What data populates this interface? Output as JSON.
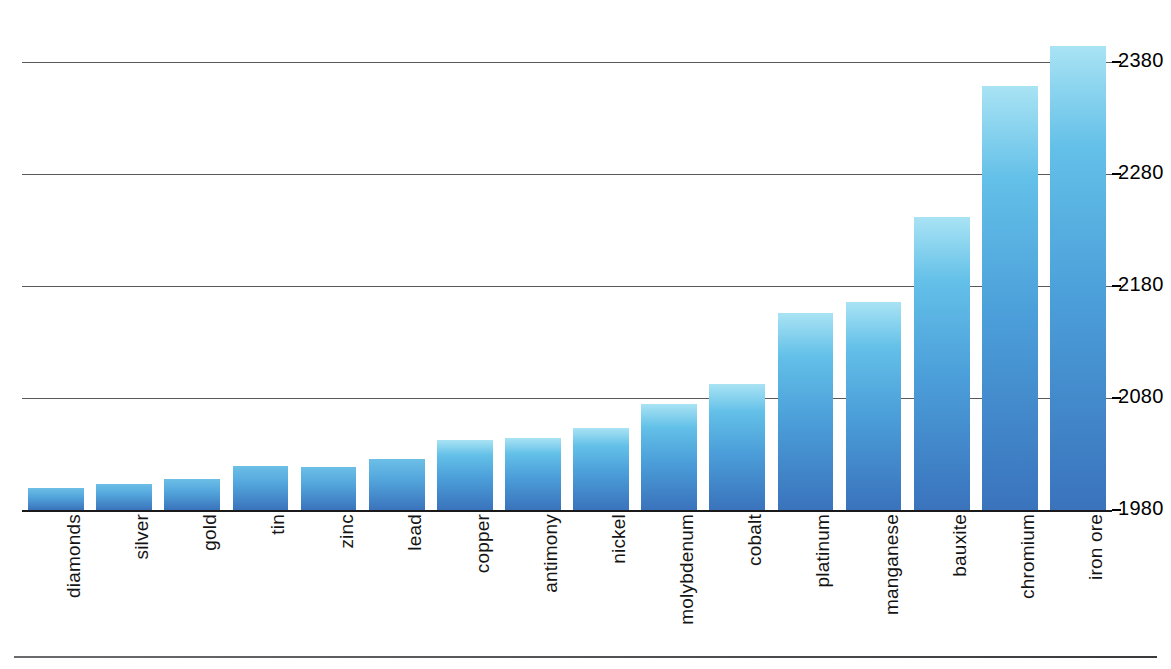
{
  "chart_data": {
    "type": "bar",
    "title": "",
    "subtitle": "",
    "xlabel": "",
    "ylabel": "",
    "ylim": [
      1980,
      2400
    ],
    "grid": true,
    "legend": "none",
    "orientation": "vertical",
    "y_tick_labels": [
      "1980",
      "2080",
      "2180",
      "2280",
      "2380"
    ],
    "y_ticks": [
      1980,
      2080,
      2180,
      2280,
      2380
    ],
    "y_axis_side": "right",
    "categories": [
      "diamonds",
      "silver",
      "gold",
      "tin",
      "zinc",
      "lead",
      "copper",
      "antimony",
      "nickel",
      "molybdenum",
      "cobalt",
      "platinum",
      "manganese",
      "bauxite",
      "chromium",
      "iron ore"
    ],
    "values": [
      2000,
      2003,
      2008,
      2019,
      2018,
      2026,
      2043,
      2044,
      2053,
      2075,
      2093,
      2156,
      2166,
      2242,
      2359,
      2395
    ],
    "bar_color_top": "#a9e3f4",
    "bar_color_bottom": "#3a73bc",
    "gridline_color": "#59595b",
    "baseline_color": "#1a1a1c",
    "background": "#ffffff"
  }
}
